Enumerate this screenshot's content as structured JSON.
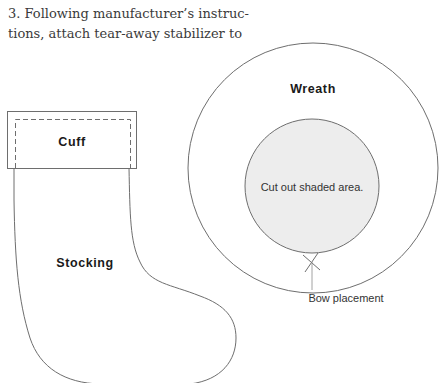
{
  "instruction": {
    "line1": "3. Following manufacturer’s instruc-",
    "line2": "tions, attach tear-away stabilizer to"
  },
  "stocking_pattern": {
    "cuff_label": "Cuff",
    "body_label": "Stocking"
  },
  "wreath_pattern": {
    "title": "Wreath",
    "center_label": "Cut out shaded area.",
    "bow_label": "Bow placement",
    "bow_marker_icon": "x-mark-icon"
  },
  "colors": {
    "line": "#6e6e6e",
    "shaded_fill": "#ededed",
    "text": "#1a1a1a"
  }
}
